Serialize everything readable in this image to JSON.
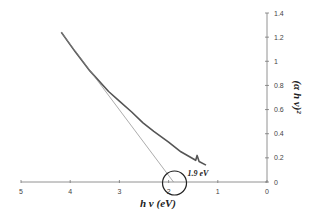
{
  "chart_data": {
    "type": "line",
    "title": "",
    "xlabel": "h v (eV)",
    "ylabel": "(α h v)²",
    "xlim": [
      5,
      0
    ],
    "ylim": [
      0,
      1.4
    ],
    "x_reversed": true,
    "y_axis_position": "right",
    "grid": false,
    "legend": "none",
    "x_ticks": [
      "5",
      "4",
      "3",
      "2",
      "1",
      "0"
    ],
    "y_ticks": [
      "0",
      "0.2",
      "0.4",
      "0.6",
      "0.8",
      "1",
      "1.2",
      "1.4"
    ],
    "series": [
      {
        "name": "Tauc plot data",
        "x": [
          4.18,
          3.9,
          3.6,
          3.22,
          3.0,
          2.75,
          2.52,
          2.3,
          2.0,
          1.75,
          1.45,
          1.42,
          1.38,
          1.24
        ],
        "y": [
          1.24,
          1.08,
          0.92,
          0.75,
          0.67,
          0.58,
          0.49,
          0.42,
          0.33,
          0.25,
          0.18,
          0.22,
          0.17,
          0.14
        ]
      },
      {
        "name": "Linear extrapolation",
        "x": [
          4.18,
          1.9
        ],
        "y": [
          1.24,
          0.0
        ]
      }
    ],
    "annotations": [
      {
        "text": "1.9 eV",
        "x": 1.9,
        "y": 0,
        "marker": "circle"
      }
    ]
  }
}
